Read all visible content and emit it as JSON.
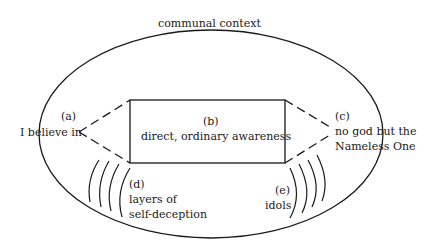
{
  "diagram": {
    "outer_label": "communal context",
    "nodes": {
      "a": {
        "tag": "(a)",
        "text": "I believe in"
      },
      "b": {
        "tag": "(b)",
        "text": "direct, ordinary awareness"
      },
      "c": {
        "tag": "(c)",
        "line1": "no god but the",
        "line2": "Nameless One"
      },
      "d": {
        "tag": "(d)",
        "line1": "layers of",
        "line2": "self-deception"
      },
      "e": {
        "tag": "(e)",
        "text": "idols"
      }
    }
  }
}
